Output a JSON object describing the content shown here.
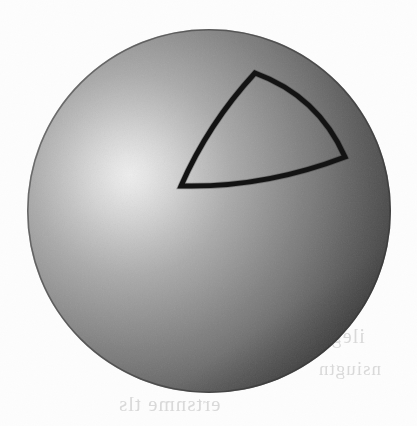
{
  "figure": {
    "caption": "",
    "background_color": "#fdfdfd",
    "width": 417,
    "height": 426
  },
  "sphere": {
    "name": "shaded-sphere",
    "center_x": 209,
    "center_y": 211,
    "radius": 182,
    "highlight_x": 130,
    "highlight_y": 175,
    "highlight_color": "#e8e8e8",
    "mid_color": "#959595",
    "shadow_color": "#3c3c3c",
    "terminator_color": "#5a5a5a",
    "edge_color": "#333333"
  },
  "spherical_triangle": {
    "name": "spherical-triangle",
    "stroke_color": "#101010",
    "stroke_width": 5,
    "fill": "none",
    "vertices": [
      {
        "label": "A",
        "x": 255,
        "y": 73
      },
      {
        "label": "B",
        "x": 345,
        "y": 157
      },
      {
        "label": "C",
        "x": 181,
        "y": 186
      }
    ],
    "arcs": [
      {
        "from": "A",
        "to": "B",
        "bulge": "outward-upper-right",
        "control_x": 318,
        "control_y": 96
      },
      {
        "from": "B",
        "to": "C",
        "bulge": "outward-downward",
        "control_x": 264,
        "control_y": 188
      },
      {
        "from": "C",
        "to": "A",
        "bulge": "outward-left",
        "control_x": 208,
        "control_y": 124
      }
    ]
  },
  "bleed_through": {
    "name": "page-bleed-through",
    "visible": true,
    "lines": [
      "ertsnme tls",
      "ilegnus",
      "nsiugtn",
      "ale"
    ]
  }
}
